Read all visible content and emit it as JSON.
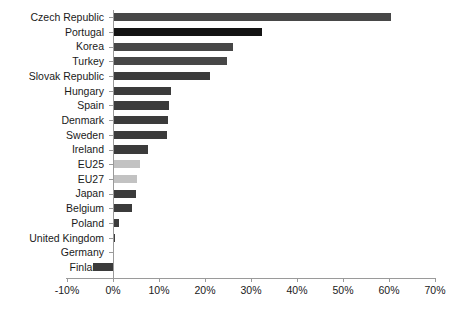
{
  "chart_data": {
    "type": "bar",
    "orientation": "horizontal",
    "title": "",
    "subtitle": "",
    "xlabel": "",
    "ylabel": "",
    "xlim": [
      -10,
      70
    ],
    "grid": false,
    "legend": "none",
    "xticks": [
      -10,
      0,
      10,
      20,
      30,
      40,
      50,
      60,
      70
    ],
    "xtick_labels": [
      "-10%",
      "0%",
      "10%",
      "20%",
      "30%",
      "40%",
      "50%",
      "60%",
      "70%"
    ],
    "categories": [
      "Czech Republic",
      "Portugal",
      "Korea",
      "Turkey",
      "Slovak Republic",
      "Hungary",
      "Spain",
      "Denmark",
      "Sweden",
      "Ireland",
      "EU25",
      "EU27",
      "Japan",
      "Belgium",
      "Poland",
      "United Kingdom",
      "Germany",
      "Finland"
    ],
    "values": [
      60.5,
      32.3,
      26.1,
      24.8,
      21.1,
      12.5,
      12.2,
      12.0,
      11.7,
      7.5,
      5.9,
      5.2,
      5.0,
      4.1,
      1.2,
      0.4,
      0.0,
      -4.3
    ],
    "bar_colors": [
      "#474747",
      "#141414",
      "#474747",
      "#474747",
      "#3b3b3b",
      "#3b3b3b",
      "#3b3b3b",
      "#3b3b3b",
      "#3b3b3b",
      "#3b3b3b",
      "#c2c2c2",
      "#c2c2c2",
      "#3b3b3b",
      "#3b3b3b",
      "#3b3b3b",
      "#3b3b3b",
      "#3b3b3b",
      "#3b3b3b"
    ],
    "colors": {
      "axis": "#9a9a9a",
      "text": "#1a1a1a",
      "background": "#ffffff",
      "bar_dark": "#3b3b3b",
      "bar_black": "#141414",
      "bar_light": "#c2c2c2"
    }
  }
}
